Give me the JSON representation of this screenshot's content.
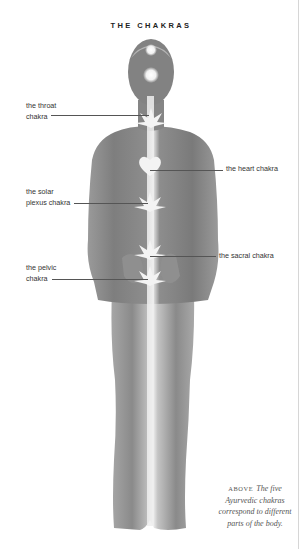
{
  "page": {
    "title": "THE CHAKRAS"
  },
  "figure": {
    "labels": [
      {
        "id": "throat",
        "line1": "the throat",
        "line2": "chakra"
      },
      {
        "id": "heart",
        "line1": "the heart chakra"
      },
      {
        "id": "solar-plexus",
        "line1": "the solar",
        "line2": "plexus chakra"
      },
      {
        "id": "sacral",
        "line1": "the sacral chakra"
      },
      {
        "id": "pelvic",
        "line1": "the pelvic",
        "line2": "chakra"
      }
    ]
  },
  "caption": {
    "prefix": "ABOVE",
    "line1": "The five",
    "line2": "Ayurvedic chakras",
    "line3": "correspond to different",
    "line4": "parts of the body."
  },
  "colors": {
    "figure_gray": "#8a8a8a",
    "figure_dark": "#6f6f6f",
    "glow": "#f4f4f4",
    "text": "#333333"
  }
}
